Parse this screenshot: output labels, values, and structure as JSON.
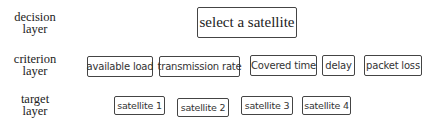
{
  "layers": {
    "decision": {
      "label_line1": "decision",
      "label_line2": "layer"
    },
    "criterion": {
      "label_line1": "criterion",
      "label_line2": "layer"
    },
    "target": {
      "label_line1": "target",
      "label_line2": "layer"
    }
  },
  "decision_nodes": [
    {
      "label": "select a satellite"
    }
  ],
  "criterion_nodes": [
    {
      "label": "available load"
    },
    {
      "label": "transmission rate"
    },
    {
      "label": "Covered time"
    },
    {
      "label": "delay"
    },
    {
      "label": "packet loss"
    }
  ],
  "target_nodes": [
    {
      "label": "satellite 1"
    },
    {
      "label": "satellite 2"
    },
    {
      "label": "satellite 3"
    },
    {
      "label": "satellite 4"
    }
  ],
  "colors": {
    "border": "#444444",
    "text": "#222222",
    "background": "#ffffff"
  }
}
